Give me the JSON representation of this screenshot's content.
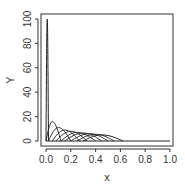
{
  "chart_data": {
    "type": "line",
    "title": "",
    "xlabel": "x",
    "ylabel": "Y",
    "xlim": [
      0,
      1
    ],
    "ylim": [
      0,
      100
    ],
    "x_ticks": [
      "0.0",
      "0.2",
      "0.4",
      "0.6",
      "0.8",
      "1.0"
    ],
    "y_ticks": [
      "0",
      "20",
      "40",
      "60",
      "80",
      "100"
    ],
    "grid": false,
    "legend": null,
    "series": [
      {
        "name": "curve-1",
        "peak_x": 0.01,
        "peak_y": 100,
        "support": [
          0.0,
          0.02
        ]
      },
      {
        "name": "curve-2",
        "peak_x": 0.05,
        "peak_y": 16,
        "support": [
          0.0,
          0.12
        ]
      },
      {
        "name": "curve-3",
        "peak_x": 0.1,
        "peak_y": 11,
        "support": [
          0.02,
          0.2
        ]
      },
      {
        "name": "curve-4",
        "peak_x": 0.15,
        "peak_y": 9,
        "support": [
          0.05,
          0.27
        ]
      },
      {
        "name": "curve-5",
        "peak_x": 0.2,
        "peak_y": 8,
        "support": [
          0.08,
          0.33
        ]
      },
      {
        "name": "curve-6",
        "peak_x": 0.25,
        "peak_y": 7,
        "support": [
          0.12,
          0.4
        ]
      },
      {
        "name": "curve-7",
        "peak_x": 0.3,
        "peak_y": 6.5,
        "support": [
          0.15,
          0.45
        ]
      },
      {
        "name": "curve-8",
        "peak_x": 0.35,
        "peak_y": 6,
        "support": [
          0.2,
          0.5
        ]
      },
      {
        "name": "curve-9",
        "peak_x": 0.4,
        "peak_y": 5.5,
        "support": [
          0.25,
          0.55
        ]
      },
      {
        "name": "curve-10",
        "peak_x": 0.45,
        "peak_y": 5,
        "support": [
          0.3,
          0.62
        ]
      }
    ]
  }
}
